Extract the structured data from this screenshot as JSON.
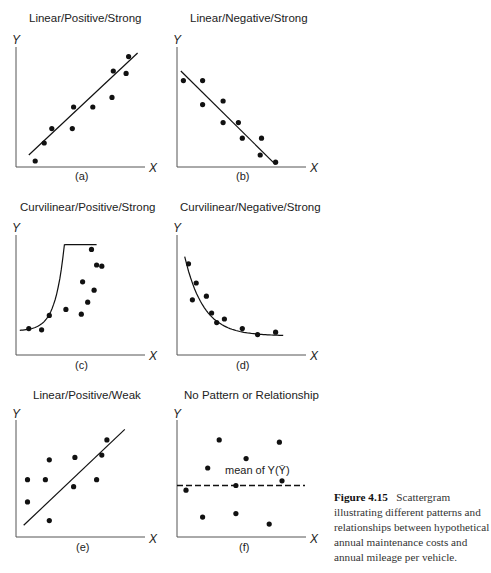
{
  "figure": {
    "caption_label": "Figure 4.15",
    "caption_text": "Scattergram illustrating different patterns and relationships between hypothetical annual maintenance costs and annual mileage per vehicle."
  },
  "chart_data": [
    {
      "type": "scatter",
      "id": "a",
      "title": "Linear/Positive/Strong",
      "subtitle": "(a)",
      "xlabel": "X",
      "ylabel": "Y",
      "grid": false,
      "fit": {
        "kind": "linear",
        "from": [
          0.1,
          0.1
        ],
        "to": [
          0.95,
          0.95
        ]
      },
      "points": [
        [
          0.15,
          0.05
        ],
        [
          0.22,
          0.2
        ],
        [
          0.28,
          0.32
        ],
        [
          0.44,
          0.32
        ],
        [
          0.45,
          0.5
        ],
        [
          0.6,
          0.5
        ],
        [
          0.75,
          0.58
        ],
        [
          0.76,
          0.8
        ],
        [
          0.86,
          0.78
        ],
        [
          0.88,
          0.92
        ]
      ],
      "xlim": [
        0,
        1
      ],
      "ylim": [
        0,
        1
      ]
    },
    {
      "type": "scatter",
      "id": "b",
      "title": "Linear/Negative/Strong",
      "subtitle": "(b)",
      "xlabel": "X",
      "ylabel": "Y",
      "grid": false,
      "fit": {
        "kind": "linear",
        "from": [
          0.03,
          0.8
        ],
        "to": [
          0.77,
          0.02
        ]
      },
      "points": [
        [
          0.05,
          0.72
        ],
        [
          0.2,
          0.72
        ],
        [
          0.2,
          0.52
        ],
        [
          0.36,
          0.55
        ],
        [
          0.36,
          0.37
        ],
        [
          0.48,
          0.37
        ],
        [
          0.51,
          0.24
        ],
        [
          0.66,
          0.24
        ],
        [
          0.65,
          0.1
        ],
        [
          0.77,
          0.04
        ]
      ],
      "xlim": [
        0,
        1
      ],
      "ylim": [
        0,
        1
      ]
    },
    {
      "type": "scatter",
      "id": "c",
      "title": "Curvilinear/Positive/Strong",
      "subtitle": "(c)",
      "xlabel": "X",
      "ylabel": "Y",
      "grid": false,
      "fit": {
        "kind": "exponential-increasing"
      },
      "points": [
        [
          0.1,
          0.22
        ],
        [
          0.2,
          0.21
        ],
        [
          0.26,
          0.33
        ],
        [
          0.39,
          0.38
        ],
        [
          0.51,
          0.34
        ],
        [
          0.52,
          0.61
        ],
        [
          0.56,
          0.44
        ],
        [
          0.61,
          0.54
        ],
        [
          0.59,
          0.88
        ],
        [
          0.63,
          0.75
        ],
        [
          0.67,
          0.74
        ]
      ],
      "xlim": [
        0,
        1
      ],
      "ylim": [
        0,
        1
      ]
    },
    {
      "type": "scatter",
      "id": "d",
      "title": "Curvilinear/Negative/Strong",
      "subtitle": "(d)",
      "xlabel": "X",
      "ylabel": "Y",
      "grid": false,
      "fit": {
        "kind": "exponential-decreasing"
      },
      "points": [
        [
          0.09,
          0.76
        ],
        [
          0.15,
          0.6
        ],
        [
          0.12,
          0.46
        ],
        [
          0.23,
          0.49
        ],
        [
          0.27,
          0.35
        ],
        [
          0.31,
          0.27
        ],
        [
          0.37,
          0.3
        ],
        [
          0.51,
          0.22
        ],
        [
          0.63,
          0.17
        ],
        [
          0.77,
          0.19
        ]
      ],
      "xlim": [
        0,
        1
      ],
      "ylim": [
        0,
        1
      ]
    },
    {
      "type": "scatter",
      "id": "e",
      "title": "Linear/Positive/Weak",
      "subtitle": "(e)",
      "xlabel": "X",
      "ylabel": "Y",
      "grid": false,
      "fit": {
        "kind": "linear",
        "from": [
          0.06,
          0.1
        ],
        "to": [
          0.85,
          0.92
        ]
      },
      "points": [
        [
          0.09,
          0.3
        ],
        [
          0.09,
          0.49
        ],
        [
          0.26,
          0.66
        ],
        [
          0.23,
          0.49
        ],
        [
          0.26,
          0.14
        ],
        [
          0.45,
          0.43
        ],
        [
          0.46,
          0.68
        ],
        [
          0.63,
          0.49
        ],
        [
          0.67,
          0.7
        ],
        [
          0.71,
          0.83
        ]
      ],
      "xlim": [
        0,
        1
      ],
      "ylim": [
        0,
        1
      ]
    },
    {
      "type": "scatter",
      "id": "f",
      "title": "No Pattern or Relationship",
      "subtitle": "(f)",
      "xlabel": "X",
      "ylabel": "Y",
      "grid": false,
      "reference_line": {
        "kind": "horizontal-dashed",
        "y": 0.44,
        "label": "mean of Y(Ȳ)"
      },
      "points": [
        [
          0.07,
          0.4
        ],
        [
          0.24,
          0.59
        ],
        [
          0.33,
          0.83
        ],
        [
          0.2,
          0.17
        ],
        [
          0.46,
          0.44
        ],
        [
          0.54,
          0.67
        ],
        [
          0.46,
          0.2
        ],
        [
          0.72,
          0.11
        ],
        [
          0.8,
          0.81
        ],
        [
          0.82,
          0.48
        ]
      ],
      "xlim": [
        0,
        1
      ],
      "ylim": [
        0,
        1
      ]
    }
  ]
}
